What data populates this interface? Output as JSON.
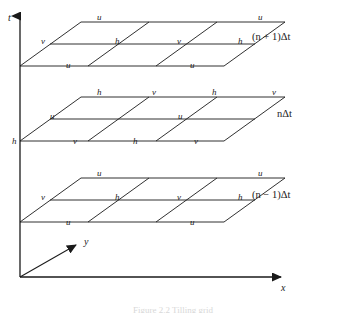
{
  "figure": {
    "type": "spacetime-staggered-grid-diagram",
    "background": "#ffffff",
    "line_color": "#1a1a1a",
    "text_color": "#1a1a1a",
    "caption": "Figure 2.2  Tilling grid"
  },
  "axes": {
    "t": {
      "label": "t",
      "label_x": 8,
      "label_y": 18
    },
    "y": {
      "label": "y",
      "label_x": 84,
      "label_y": 239
    },
    "x": {
      "label": "x",
      "label_x": 281,
      "label_y": 285
    },
    "origin_x": 20,
    "origin_y": 277
  },
  "planes": [
    {
      "id": "plane-n-plus-1",
      "time_label": "(n + 1)Δt",
      "time_label_x": 252,
      "time_label_y": 38,
      "nodes": [
        {
          "v": "u",
          "x": 97,
          "y": 13
        },
        {
          "v": "u",
          "x": 258,
          "y": 13
        },
        {
          "v": "v",
          "x": 41,
          "y": 37
        },
        {
          "v": "h",
          "x": 115,
          "y": 37
        },
        {
          "v": "v",
          "x": 177,
          "y": 37
        },
        {
          "v": "h",
          "x": 238,
          "y": 37
        },
        {
          "v": "u",
          "x": 66,
          "y": 61
        },
        {
          "v": "u",
          "x": 190,
          "y": 61
        }
      ]
    },
    {
      "id": "plane-n",
      "time_label": "nΔt",
      "time_label_x": 277,
      "time_label_y": 115,
      "nodes": [
        {
          "v": "h",
          "x": 97,
          "y": 88
        },
        {
          "v": "v",
          "x": 152,
          "y": 88
        },
        {
          "v": "h",
          "x": 212,
          "y": 88
        },
        {
          "v": "v",
          "x": 272,
          "y": 88
        },
        {
          "v": "u",
          "x": 50,
          "y": 112
        },
        {
          "v": "u",
          "x": 178,
          "y": 112
        },
        {
          "v": "h",
          "x": 12,
          "y": 137
        },
        {
          "v": "v",
          "x": 73,
          "y": 137
        },
        {
          "v": "h",
          "x": 133,
          "y": 137
        },
        {
          "v": "v",
          "x": 194,
          "y": 137
        }
      ]
    },
    {
      "id": "plane-n-minus-1",
      "time_label": "(n − 1)Δt",
      "time_label_x": 252,
      "time_label_y": 196,
      "nodes": [
        {
          "v": "u",
          "x": 97,
          "y": 169
        },
        {
          "v": "u",
          "x": 258,
          "y": 169
        },
        {
          "v": "v",
          "x": 41,
          "y": 193
        },
        {
          "v": "h",
          "x": 115,
          "y": 193
        },
        {
          "v": "v",
          "x": 177,
          "y": 193
        },
        {
          "v": "h",
          "x": 238,
          "y": 193
        },
        {
          "v": "u",
          "x": 66,
          "y": 218
        },
        {
          "v": "u",
          "x": 190,
          "y": 218
        }
      ]
    }
  ]
}
